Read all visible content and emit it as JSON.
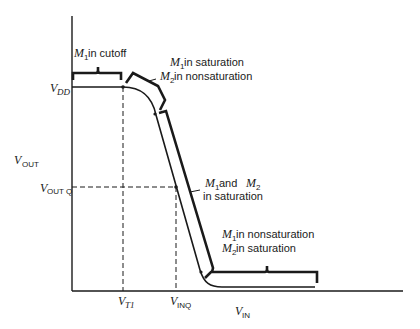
{
  "diagram": {
    "axes": {
      "y_label": {
        "main": "V",
        "sub": "OUT"
      },
      "x_label": {
        "main": "V",
        "sub": "IN"
      }
    },
    "y_ticks": [
      {
        "main": "V",
        "sub": "DD"
      },
      {
        "main": "V",
        "sub": "OUT Q"
      }
    ],
    "x_ticks": [
      {
        "main": "V",
        "sub": "T1"
      },
      {
        "main": "V",
        "sub": "INQ"
      }
    ],
    "regions": [
      {
        "line1_m": "M",
        "line1_sub": "1",
        "line1_text": " in cutoff"
      },
      {
        "line1_m": "M",
        "line1_sub": "1",
        "line1_text": " in saturation",
        "line2_m": "M",
        "line2_sub": "2",
        "line2_text": " in nonsaturation"
      },
      {
        "line1_m": "M",
        "line1_sub": "1",
        "line1_text": " and ",
        "line1_m2": "M",
        "line1_sub2": "2",
        "line2_text": "in saturation"
      },
      {
        "line1_m": "M",
        "line1_sub": "1",
        "line1_text": " in nonsaturation",
        "line2_m": "M",
        "line2_sub": "2",
        "line2_text": " in saturation"
      }
    ],
    "colors": {
      "ink": "#1a1a1a",
      "background": "#ffffff"
    }
  }
}
